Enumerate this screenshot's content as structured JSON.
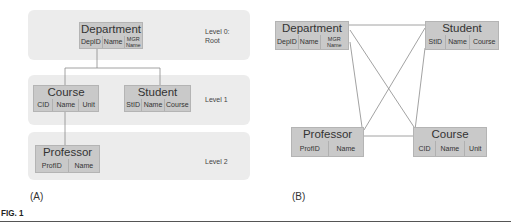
{
  "figure": {
    "label": "FIG. 1",
    "panels": {
      "a": {
        "label": "(A)",
        "levels": [
          {
            "label_line1": "Level 0:",
            "label_line2": "Root"
          },
          {
            "label_line1": "Level 1"
          },
          {
            "label_line1": "Level 2"
          }
        ],
        "entities": {
          "department": {
            "title": "Department",
            "attrs": [
              "DepID",
              "Name",
              "MGR Name"
            ]
          },
          "course": {
            "title": "Course",
            "attrs": [
              "CID",
              "Name",
              "Unit"
            ]
          },
          "student": {
            "title": "Student",
            "attrs": [
              "StID",
              "Name",
              "Course"
            ]
          },
          "professor": {
            "title": "Professor",
            "attrs": [
              "ProfID",
              "Name"
            ]
          }
        },
        "edges": [
          [
            "department",
            "course"
          ],
          [
            "department",
            "student"
          ],
          [
            "course",
            "professor"
          ]
        ]
      },
      "b": {
        "label": "(B)",
        "entities": {
          "department": {
            "title": "Department",
            "attrs": [
              "DepID",
              "Name",
              "MGR Name"
            ]
          },
          "student": {
            "title": "Student",
            "attrs": [
              "StID",
              "Name",
              "Course"
            ]
          },
          "professor": {
            "title": "Professor",
            "attrs": [
              "ProfID",
              "Name"
            ]
          },
          "course": {
            "title": "Course",
            "attrs": [
              "CID",
              "Name",
              "Unit"
            ]
          }
        },
        "edges": [
          [
            "department",
            "student"
          ],
          [
            "department",
            "professor"
          ],
          [
            "department",
            "course"
          ],
          [
            "student",
            "professor"
          ],
          [
            "student",
            "course"
          ],
          [
            "professor",
            "course"
          ]
        ]
      }
    }
  }
}
